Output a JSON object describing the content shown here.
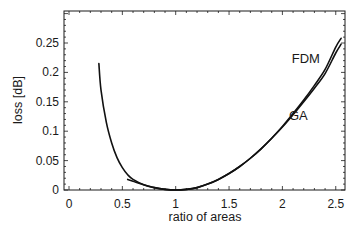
{
  "chart_data": {
    "type": "line",
    "title": "",
    "xlabel": "ratio of areas",
    "ylabel": "loss [dB]",
    "xlim": [
      -0.05,
      2.6
    ],
    "ylim": [
      0,
      0.3
    ],
    "xticks": [
      0,
      0.5,
      1,
      1.5,
      2,
      2.5
    ],
    "xtick_labels": [
      "0",
      "0.5",
      "1",
      "1.5",
      "2",
      "2.5"
    ],
    "yticks": [
      0,
      0.05,
      0.1,
      0.15,
      0.2,
      0.25
    ],
    "ytick_labels": [
      "0",
      "0.05",
      "0.1",
      "0.15",
      "0.2",
      "0.25"
    ],
    "grid": false,
    "legend": "inline labels near curves",
    "series": [
      {
        "name": "FDM",
        "x": [
          0.28,
          0.3,
          0.35,
          0.4,
          0.45,
          0.5,
          0.55,
          0.6,
          0.7,
          0.8,
          0.9,
          1.0,
          1.1,
          1.2,
          1.3,
          1.4,
          1.5,
          1.6,
          1.7,
          1.8,
          1.9,
          2.0,
          2.1,
          2.2,
          2.3,
          2.4,
          2.5,
          2.55
        ],
        "values": [
          0.215,
          0.17,
          0.115,
          0.08,
          0.055,
          0.038,
          0.026,
          0.018,
          0.009,
          0.004,
          0.001,
          0.0,
          0.001,
          0.004,
          0.01,
          0.018,
          0.028,
          0.04,
          0.054,
          0.07,
          0.088,
          0.108,
          0.13,
          0.153,
          0.178,
          0.205,
          0.243,
          0.258
        ]
      },
      {
        "name": "GA",
        "x": [
          0.55,
          0.6,
          0.7,
          0.8,
          0.9,
          1.0,
          1.1,
          1.2,
          1.3,
          1.4,
          1.5,
          1.6,
          1.7,
          1.8,
          1.9,
          2.0,
          2.1,
          2.2,
          2.3,
          2.4,
          2.5,
          2.55
        ],
        "values": [
          0.018,
          0.015,
          0.009,
          0.004,
          0.001,
          0.0,
          0.001,
          0.004,
          0.01,
          0.018,
          0.028,
          0.04,
          0.054,
          0.07,
          0.088,
          0.107,
          0.128,
          0.15,
          0.173,
          0.198,
          0.233,
          0.248
        ]
      }
    ],
    "annotations": [
      {
        "text": "FDM",
        "x": 2.22,
        "y": 0.225
      },
      {
        "text": "GA",
        "x": 2.15,
        "y": 0.127
      }
    ]
  }
}
